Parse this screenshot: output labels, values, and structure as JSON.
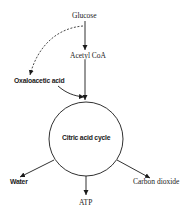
{
  "diagram": {
    "nodes": {
      "glucose": "Glucose",
      "acetyl_coa": "Acetyl CoA",
      "oxaloacetic_acid": "Oxaloacetic acid",
      "cycle": "Citric acid cycle",
      "water": "Water",
      "atp": "ATP",
      "carbon_dioxide": "Carbon dioxide"
    },
    "edges": [
      {
        "from": "Glucose",
        "to": "Acetyl CoA",
        "style": "solid"
      },
      {
        "from": "Acetyl CoA",
        "to": "Citric acid cycle",
        "style": "solid"
      },
      {
        "from": "Glucose",
        "to": "Oxaloacetic acid",
        "style": "dashed"
      },
      {
        "from": "Oxaloacetic acid",
        "to": "Citric acid cycle",
        "style": "solid"
      },
      {
        "from": "Citric acid cycle",
        "to": "Water",
        "style": "solid"
      },
      {
        "from": "Citric acid cycle",
        "to": "ATP",
        "style": "solid"
      },
      {
        "from": "Citric acid cycle",
        "to": "Carbon dioxide",
        "style": "solid"
      }
    ],
    "colors": {
      "line": "#1a1a1a",
      "background": "#ffffff"
    }
  }
}
